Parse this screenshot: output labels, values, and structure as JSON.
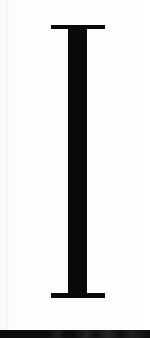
{
  "document": {
    "kind": "scanned-glyph-specimen",
    "glyph": {
      "character": "I",
      "name": "latin-capital-letter-i",
      "style": "serif-slab",
      "color": "#090909",
      "stem": {
        "x": 68,
        "y": 25,
        "width": 19,
        "height": 273
      },
      "serif_top": {
        "x": 51,
        "y": 25,
        "width": 54,
        "height": 4
      },
      "serif_bottom": {
        "x": 51,
        "y": 293,
        "width": 54,
        "height": 5
      }
    },
    "canvas": {
      "width": 150,
      "height": 338,
      "background_color": "#fcfcfc",
      "paper_color": "#fdfdfd"
    },
    "artifacts": {
      "scan_rule_left": {
        "x": 6,
        "color": "#f0f0f0"
      },
      "scan_edge_band": {
        "y": 330,
        "height": 8,
        "color": "#0d0d0d"
      }
    }
  }
}
